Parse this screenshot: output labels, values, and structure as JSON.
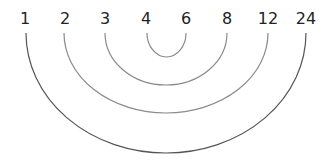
{
  "diagram": {
    "title": "",
    "type": "factor-pair arcs",
    "labels": [
      "1",
      "2",
      "3",
      "4",
      "6",
      "8",
      "12",
      "24"
    ],
    "pairs": [
      {
        "left": "1",
        "right": "24"
      },
      {
        "left": "2",
        "right": "12"
      },
      {
        "left": "3",
        "right": "8"
      },
      {
        "left": "4",
        "right": "6"
      }
    ],
    "colors": {
      "text": "#222222",
      "outer_arc": "#555555",
      "inner_arc": "#888888",
      "background": "#ffffff"
    }
  }
}
